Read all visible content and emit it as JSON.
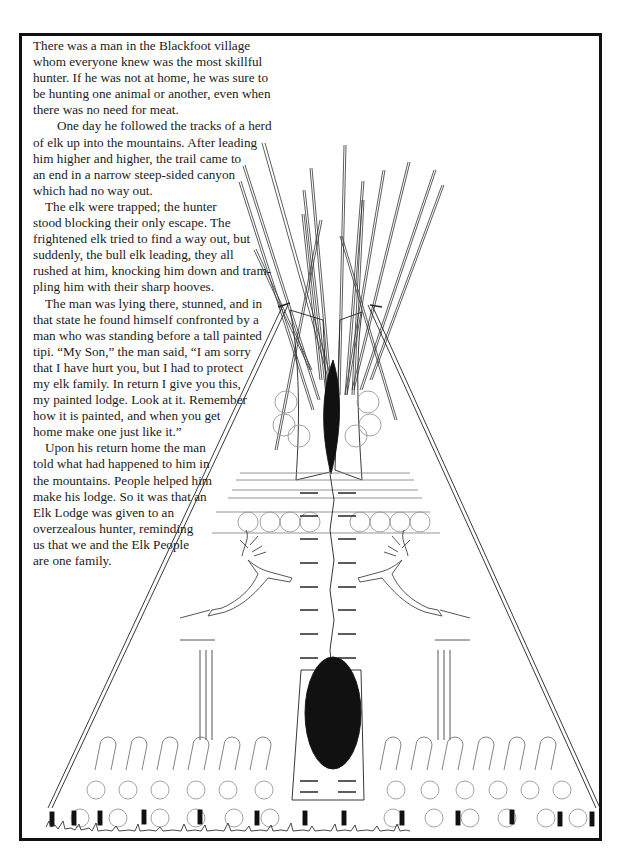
{
  "page": {
    "type": "coloring-page",
    "title": "Elk Lodge"
  },
  "story": {
    "paragraphs": [
      {
        "lines": [
          "There was a man in the Blackfoot village",
          "whom everyone knew was the most skillful",
          "hunter. If he was not at home, he was sure to",
          "be hunting one animal or another, even when",
          "there was no need for meat."
        ]
      },
      {
        "lines": [
          "One day he followed the tracks of a herd",
          "of elk up into the mountains. After leading",
          "him higher and higher, the trail came to",
          "an end in a narrow steep-sided canyon",
          "which had no way out."
        ]
      },
      {
        "lines": [
          "The elk were trapped; the hunter",
          "stood blocking their only escape. The",
          "frightened elk tried to find a way out, but",
          "suddenly, the bull elk leading, they all",
          "rushed at him, knocking him down and tram-",
          "pling him with their sharp hooves."
        ]
      },
      {
        "lines": [
          "The man was lying there, stunned, and in",
          "that state he found himself confronted by a",
          "man who was standing before a tall painted",
          "tipi. “My Son,” the man said, “I am sorry",
          "that I have hurt you, but I had to protect",
          "my elk family. In return I give you this,",
          "my painted lodge. Look at it. Remember",
          "how it is painted, and when you get",
          "home make one just like it.”"
        ]
      },
      {
        "lines": [
          "Upon his return home the man",
          "told what had happened to him in",
          "the mountains. People helped him",
          "make his lodge. So it was that an",
          "Elk Lodge was given to an",
          "overzealous hunter, reminding",
          "us that we and the Elk People",
          "are one family."
        ]
      }
    ]
  },
  "illustration": {
    "subject": "painted elk tipi",
    "elements": [
      "tipi-poles",
      "smoke-flaps",
      "smoke-hole",
      "elk-left",
      "elk-right",
      "lacing-pins",
      "door-oval",
      "bottom-border-circles",
      "bottom-arch-pattern",
      "tent-stakes",
      "grass"
    ],
    "line_color": "#222222",
    "fill_color": "#000000"
  }
}
